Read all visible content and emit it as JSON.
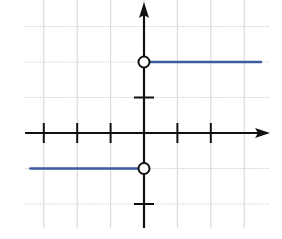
{
  "chart_data": {
    "type": "line",
    "title": "",
    "xlabel": "",
    "ylabel": "",
    "xlim": [
      -3.5,
      3.7
    ],
    "ylim": [
      -2.7,
      3.8
    ],
    "grid": true,
    "legend": null,
    "x_ticks": [
      -3,
      -2,
      -1,
      1,
      2
    ],
    "y_ticks": [
      -2,
      1
    ],
    "series": [
      {
        "name": "left-piece",
        "x": [
          -3.4,
          0
        ],
        "y": [
          -1,
          -1
        ],
        "color": "#3d5a9a"
      },
      {
        "name": "right-piece",
        "x": [
          0,
          3.5
        ],
        "y": [
          2,
          2
        ],
        "color": "#3d5a9a"
      }
    ],
    "points": [
      {
        "x": 0,
        "y": -1,
        "style": "open-circle"
      },
      {
        "x": 0,
        "y": 2,
        "style": "open-circle"
      }
    ]
  },
  "colors": {
    "line": "#3d5a9a",
    "axis": "#111111",
    "grid": "#d4d4d4",
    "background": "#ffffff"
  }
}
